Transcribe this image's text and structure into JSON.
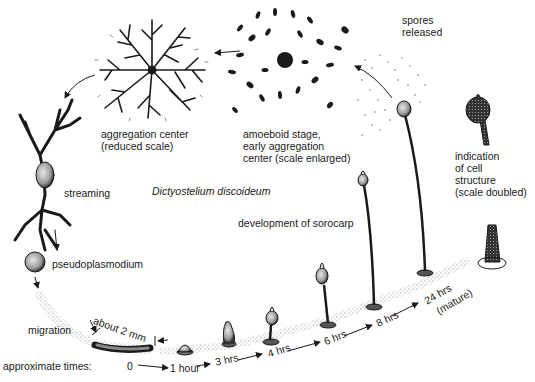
{
  "title": "Dictyostelium discoideum",
  "stages": {
    "aggregation_center": {
      "line1": "aggregation center",
      "line2": "(reduced scale)"
    },
    "amoeboid": {
      "line1": "amoeboid stage,",
      "line2": "early aggregation",
      "line3": "center (scale enlarged)"
    },
    "spores": {
      "line1": "spores",
      "line2": "released"
    },
    "cell_structure": {
      "line1": "indication",
      "line2": "of cell",
      "line3": "structure",
      "line4": "(scale doubled)"
    },
    "streaming": "streaming",
    "pseudoplasmodium": "pseudoplasmodium",
    "sorocarp": "development of sorocarp",
    "migration": "migration",
    "size_note": "about 2 mm"
  },
  "timeline": {
    "label": "approximate times:",
    "times": [
      "0",
      "1 hour",
      "3 hrs",
      "4 hrs",
      "6 hrs",
      "8 hrs",
      "24 hrs",
      "(mature)"
    ]
  },
  "colors": {
    "ink": "#1a1a1a",
    "background": "#ffffff",
    "stipple": "#9a9a9a"
  }
}
